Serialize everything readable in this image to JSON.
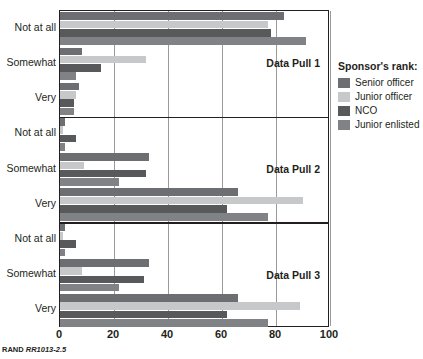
{
  "footer": {
    "source_label": "RAND",
    "report_code": "RR1013-2.5"
  },
  "legend": {
    "title": "Sponsor's rank:",
    "entries": [
      {
        "label": "Senior officer",
        "color": "#6d6e71"
      },
      {
        "label": "Junior officer",
        "color": "#c7c8ca"
      },
      {
        "label": "NCO",
        "color": "#58595b"
      },
      {
        "label": "Junior enlisted",
        "color": "#808285"
      }
    ]
  },
  "chart_data": {
    "type": "bar",
    "orientation": "horizontal",
    "title": "",
    "xlabel": "",
    "ylabel": "",
    "xlim": [
      0,
      100
    ],
    "xticks": [
      0,
      20,
      40,
      60,
      80,
      100
    ],
    "grid": true,
    "legend_position": "right",
    "categories": [
      "Not at all",
      "Somewhat",
      "Very"
    ],
    "panels": [
      {
        "name": "Data Pull 1",
        "series": [
          {
            "name": "Senior officer",
            "values": [
              83,
              8,
              7
            ]
          },
          {
            "name": "Junior officer",
            "values": [
              77,
              32,
              6
            ]
          },
          {
            "name": "NCO",
            "values": [
              78,
              15,
              5
            ]
          },
          {
            "name": "Junior enlisted",
            "values": [
              91,
              6,
              5
            ]
          }
        ]
      },
      {
        "name": "Data Pull 2",
        "series": [
          {
            "name": "Senior officer",
            "values": [
              2,
              33,
              66
            ]
          },
          {
            "name": "Junior officer",
            "values": [
              1,
              9,
              90
            ]
          },
          {
            "name": "NCO",
            "values": [
              6,
              32,
              62
            ]
          },
          {
            "name": "Junior enlisted",
            "values": [
              2,
              22,
              77
            ]
          }
        ]
      },
      {
        "name": "Data Pull 3",
        "series": [
          {
            "name": "Senior officer",
            "values": [
              2,
              33,
              66
            ]
          },
          {
            "name": "Junior officer",
            "values": [
              1,
              8,
              89
            ]
          },
          {
            "name": "NCO",
            "values": [
              6,
              31,
              62
            ]
          },
          {
            "name": "Junior enlisted",
            "values": [
              2,
              22,
              77
            ]
          }
        ]
      }
    ]
  }
}
